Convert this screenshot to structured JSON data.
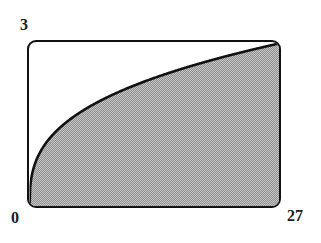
{
  "figure": {
    "background_color": "#ffffff",
    "frame_color": "#111111",
    "shade_color": "#a9a9a9",
    "curve_color": "#111111"
  },
  "labels": {
    "y_max": "3",
    "origin": "0",
    "x_max": "27"
  },
  "chart_data": {
    "type": "area",
    "title": "",
    "subtitle": "",
    "xlabel": "",
    "ylabel": "",
    "function": "y = x^(1/3)",
    "xlim": [
      0,
      27
    ],
    "ylim": [
      0,
      3
    ],
    "xticks": [
      0,
      27
    ],
    "xticklabels": [
      "0",
      "27"
    ],
    "yticks": [
      0,
      3
    ],
    "yticklabels": [
      "0",
      "3"
    ],
    "grid": false,
    "legend": false,
    "legend_position": "none",
    "fill_between": {
      "from": "curve",
      "to": "y=0",
      "color": "#a9a9a9",
      "pattern": "50% dither halftone"
    },
    "annotations": [],
    "series": [
      {
        "name": "y = x^(1/3)",
        "color": "#111111",
        "x": [
          0,
          0.25,
          0.5,
          1,
          1.5,
          2,
          3,
          4,
          5,
          6,
          7,
          8,
          9,
          10,
          11,
          12,
          13,
          14,
          15,
          16,
          17,
          18,
          19,
          20,
          21,
          22,
          23,
          24,
          25,
          26,
          27
        ],
        "y": [
          0,
          0.63,
          0.794,
          1,
          1.145,
          1.26,
          1.442,
          1.587,
          1.71,
          1.817,
          1.913,
          2,
          2.08,
          2.154,
          2.224,
          2.289,
          2.351,
          2.41,
          2.466,
          2.52,
          2.571,
          2.621,
          2.668,
          2.714,
          2.759,
          2.802,
          2.844,
          2.884,
          2.924,
          2.962,
          3
        ]
      }
    ]
  }
}
